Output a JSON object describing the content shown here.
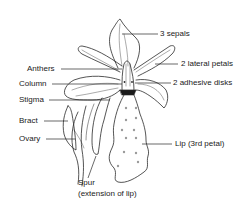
{
  "diagram": {
    "line_color": "#2a2a2a",
    "background": "#ffffff",
    "labels": {
      "sepals": "3 sepals",
      "lateral_petals": "2 lateral petals",
      "adhesive_disks": "2 adhesive disks",
      "anthers": "Anthers",
      "column": "Column",
      "stigma": "Stigma",
      "bract": "Bract",
      "ovary": "Ovary",
      "lip": "Lip (3rd petal)",
      "spur": "Spur",
      "spur_note": "(extension of lip)"
    }
  }
}
